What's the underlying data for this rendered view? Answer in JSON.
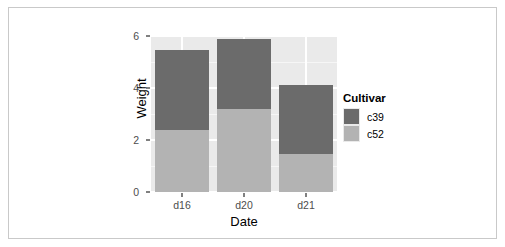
{
  "chart_data": {
    "type": "bar",
    "subtype": "stacked",
    "title": "",
    "xlabel": "Date",
    "ylabel": "Weight",
    "categories": [
      "d16",
      "d20",
      "d21"
    ],
    "series": [
      {
        "name": "c52",
        "color": "#b3b3b3",
        "values": [
          2.4,
          3.2,
          1.45
        ]
      },
      {
        "name": "c39",
        "color": "#6b6b6b",
        "values": [
          3.05,
          2.7,
          2.65
        ]
      }
    ],
    "stack_totals": [
      5.45,
      5.9,
      4.1
    ],
    "ylim": [
      0,
      6
    ],
    "y_ticks": [
      0,
      2,
      4,
      6
    ],
    "y_tick_labels": [
      "0",
      "2",
      "4",
      "6"
    ],
    "y_minor_ticks": [
      1,
      3,
      5
    ],
    "grid": true,
    "legend": {
      "title": "Cultivar",
      "position": "right",
      "entries": [
        {
          "label": "c39",
          "color": "#6b6b6b"
        },
        {
          "label": "c52",
          "color": "#b3b3b3"
        }
      ]
    },
    "panel_background": "#eaeaea",
    "gridline_color": "#ffffff"
  }
}
